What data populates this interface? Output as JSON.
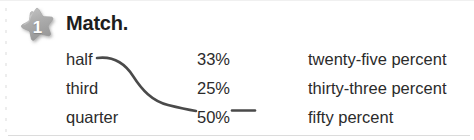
{
  "card": {
    "exercise_number": "1",
    "instruction": "Match.",
    "badge_icon": "star-badge-icon"
  },
  "columns": {
    "terms_header": "",
    "terms": [
      "half",
      "third",
      "quarter"
    ],
    "values": [
      "33%",
      "25%",
      "50%"
    ],
    "words": [
      "twenty-five percent",
      "thirty-three percent",
      "fifty percent"
    ]
  },
  "connections": [
    {
      "from": "half",
      "to": "50%",
      "style": "curve"
    },
    {
      "from": "50%",
      "to": "fifty percent",
      "style": "straight"
    }
  ],
  "colors": {
    "text": "#2b2b2b",
    "title": "#1d1d1d",
    "badge": "#a9a9a9",
    "badge_number": "#ffffff",
    "connector": "#4a4a4a",
    "rule": "#dcdcdc",
    "background": "#ffffff"
  }
}
